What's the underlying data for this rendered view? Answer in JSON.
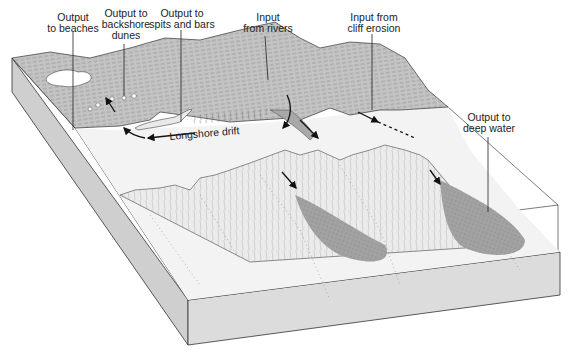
{
  "diagram": {
    "type": "block-diagram",
    "labels": {
      "output_beaches": {
        "line1": "Output",
        "line2": "to beaches"
      },
      "output_dunes": {
        "line1": "Output to",
        "line2": "backshore",
        "line3": "dunes"
      },
      "output_spits": {
        "line1": "Output to",
        "line2": "spits and bars"
      },
      "input_rivers": {
        "line1": "Input",
        "line2": "from rivers"
      },
      "input_cliff": {
        "line1": "Input from",
        "line2": "cliff erosion"
      },
      "output_deep": {
        "line1": "Output to",
        "line2": "deep water"
      },
      "longshore": "Longshore drift"
    },
    "colors": {
      "land": "#c4c4c4",
      "land_dark": "#a8a8a8",
      "shelf": "#efefef",
      "block_side": "#d6d6d6",
      "fan": "#9c9c9c",
      "line": "#333333"
    }
  }
}
